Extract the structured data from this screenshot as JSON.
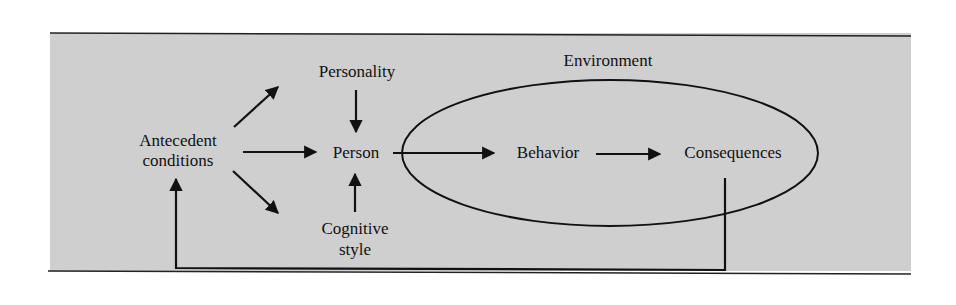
{
  "diagram": {
    "colors": {
      "panel_background": "#cfcfcf",
      "line": "#111111",
      "text": "#111111",
      "page_background": "#ffffff"
    },
    "nodes": {
      "personality": "Personality",
      "antecedent_line1": "Antecedent",
      "antecedent_line2": "conditions",
      "person": "Person",
      "cognitive_line1": "Cognitive",
      "cognitive_line2": "style",
      "environment": "Environment",
      "behavior": "Behavior",
      "consequences": "Consequences"
    },
    "edges": [
      {
        "from": "Antecedent conditions",
        "to": "Personality"
      },
      {
        "from": "Antecedent conditions",
        "to": "Person"
      },
      {
        "from": "Antecedent conditions",
        "to": "Cognitive style"
      },
      {
        "from": "Personality",
        "to": "Person"
      },
      {
        "from": "Cognitive style",
        "to": "Person"
      },
      {
        "from": "Person",
        "to": "Behavior"
      },
      {
        "from": "Behavior",
        "to": "Consequences"
      },
      {
        "from": "Consequences",
        "to": "Antecedent conditions",
        "type": "feedback"
      }
    ],
    "groups": [
      {
        "label": "Environment",
        "contains": [
          "Behavior",
          "Consequences"
        ],
        "shape": "ellipse"
      }
    ]
  }
}
